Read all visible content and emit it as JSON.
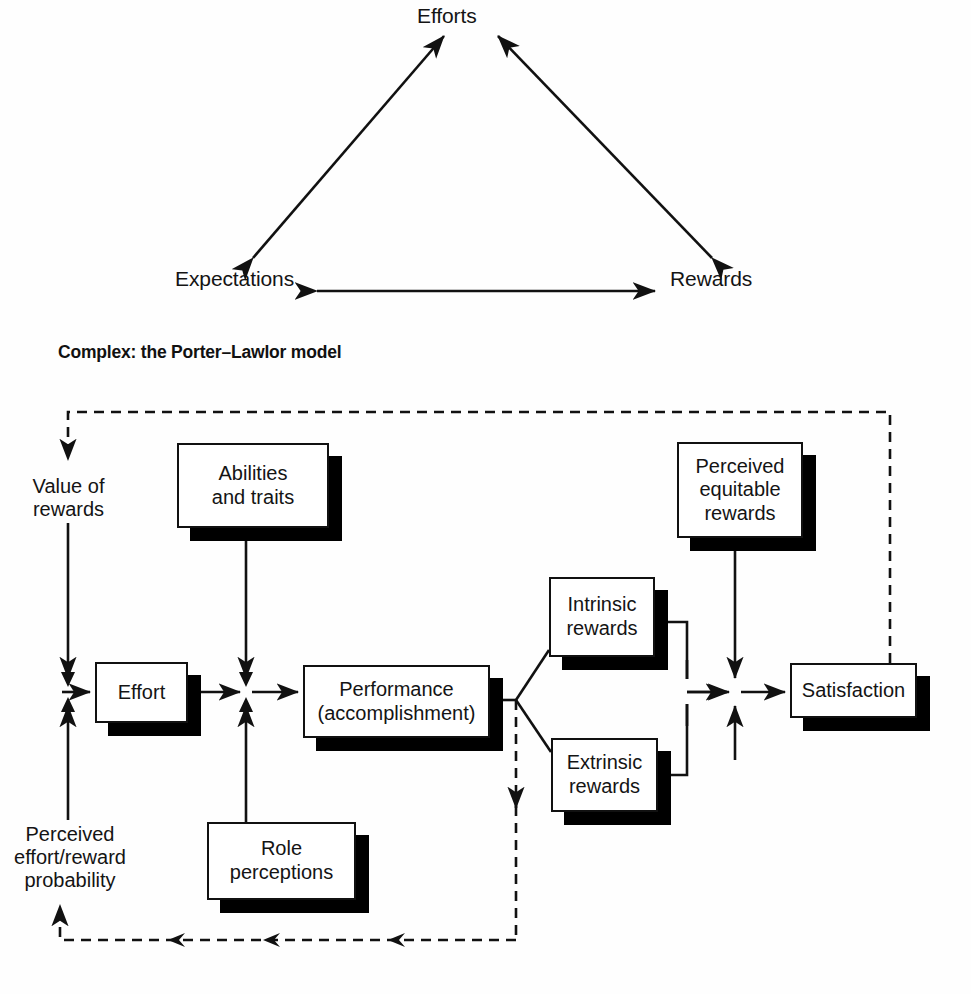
{
  "triangle": {
    "name": "simple-expectancy-triangle",
    "nodes": [
      {
        "id": "efforts",
        "label": "Efforts"
      },
      {
        "id": "expectations",
        "label": "Expectations"
      },
      {
        "id": "rewards",
        "label": "Rewards"
      }
    ],
    "edges": [
      {
        "from": "expectations",
        "to": "efforts",
        "style": "solid",
        "arrows": "both"
      },
      {
        "from": "rewards",
        "to": "efforts",
        "style": "solid",
        "arrows": "both"
      },
      {
        "from": "expectations",
        "to": "rewards",
        "style": "solid",
        "arrows": "both"
      }
    ]
  },
  "heading": {
    "text": "Complex: the Porter–Lawlor model"
  },
  "model": {
    "name": "porter-lawlor-model",
    "free_nodes": [
      {
        "id": "value-of-rewards",
        "label": "Value of\nrewards"
      },
      {
        "id": "perceived-effort-reward-probability",
        "label": "Perceived\neffort/reward\nprobability"
      }
    ],
    "boxes": [
      {
        "id": "abilities-and-traits",
        "label": "Abilities\nand traits"
      },
      {
        "id": "perceived-equitable-rewards",
        "label": "Perceived\nequitable\nrewards"
      },
      {
        "id": "intrinsic-rewards",
        "label": "Intrinsic\nrewards"
      },
      {
        "id": "effort",
        "label": "Effort"
      },
      {
        "id": "performance",
        "label": "Performance\n(accomplishment)"
      },
      {
        "id": "satisfaction",
        "label": "Satisfaction"
      },
      {
        "id": "extrinsic-rewards",
        "label": "Extrinsic\nrewards"
      },
      {
        "id": "role-perceptions",
        "label": "Role\nperceptions"
      }
    ],
    "edges": [
      {
        "from": "satisfaction",
        "to": "value-of-rewards",
        "style": "dashed"
      },
      {
        "from": "value-of-rewards",
        "to": "effort-junction",
        "style": "solid"
      },
      {
        "from": "perceived-effort-reward-probability",
        "to": "effort-junction",
        "style": "solid"
      },
      {
        "from": "effort",
        "to": "performance-junction",
        "style": "solid"
      },
      {
        "from": "abilities-and-traits",
        "to": "performance-junction",
        "style": "solid"
      },
      {
        "from": "role-perceptions",
        "to": "performance-junction",
        "style": "solid"
      },
      {
        "from": "performance-junction",
        "to": "performance",
        "style": "solid"
      },
      {
        "from": "performance",
        "to": "intrinsic-rewards",
        "style": "solid"
      },
      {
        "from": "performance",
        "to": "extrinsic-rewards",
        "style": "solid"
      },
      {
        "from": "performance",
        "to": "perceived-effort-reward-probability",
        "style": "dashed"
      },
      {
        "from": "intrinsic-rewards",
        "to": "satisfaction-junction",
        "style": "solid"
      },
      {
        "from": "extrinsic-rewards",
        "to": "satisfaction-junction",
        "style": "solid"
      },
      {
        "from": "perceived-equitable-rewards",
        "to": "satisfaction-junction",
        "style": "solid"
      },
      {
        "from": "satisfaction-junction",
        "to": "satisfaction",
        "style": "solid"
      }
    ]
  },
  "colors": {
    "ink": "#111111",
    "paper": "#fefefe",
    "shadow": "#000000"
  }
}
